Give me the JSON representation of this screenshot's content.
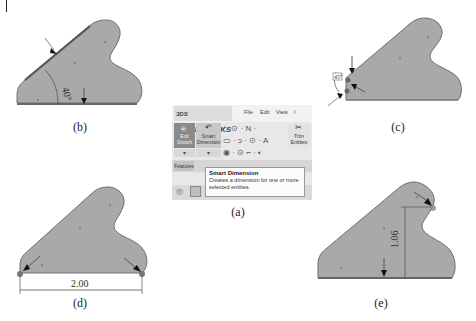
{
  "figure": {
    "panels": [
      {
        "id": "a",
        "caption": "(a)",
        "description": "SolidWorks Smart Dimension tool in the Sketch toolbar"
      },
      {
        "id": "b",
        "caption": "(b)",
        "dimension_label": "40°",
        "description": "Angular dimension between slanted edge and bottom edge"
      },
      {
        "id": "c",
        "caption": "(c)",
        "dimension_label": "45°",
        "description": "Angular dimension placed at lower-left vertex"
      },
      {
        "id": "d",
        "caption": "(d)",
        "dimension_label": "2.00",
        "description": "Horizontal dimension between two bottom corners"
      },
      {
        "id": "e",
        "caption": "(e)",
        "dimension_label": "1.06",
        "description": "Vertical dimension from arc center to bottom edge"
      }
    ]
  },
  "solidworks": {
    "logo_text": "SOLIDWORKS",
    "logo_prefix": "3DS",
    "menu": [
      "File",
      "Edit",
      "View",
      "I"
    ],
    "buttons": {
      "exit_sketch_line1": "Exit",
      "exit_sketch_line2": "Sketch",
      "smart_dimension_line1": "Smart",
      "smart_dimension_line2": "Dimension",
      "trim_line1": "Trim",
      "trim_line2": "Entities"
    },
    "tools_row1": "⁄ · ⊙ · N ·  ",
    "tools_row2": "▭ · ↄ · ⊙ · A",
    "tools_row3": "◉ · ⊙   ⌐ · ▪",
    "dropdown_glyph": "▾",
    "tab_features": "Features",
    "tooltip": {
      "title": "Smart Dimension",
      "body": "Creates a dimension for one or more selected entities."
    }
  },
  "colors": {
    "part_fill": "#a9a9a9",
    "part_edge": "#6e6e6e",
    "highlight_edge": "#5a5a5a",
    "arrow": "#111111",
    "dim_line": "#444444"
  }
}
